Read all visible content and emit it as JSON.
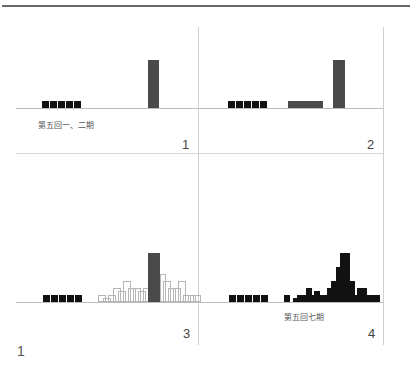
{
  "figure": {
    "number_label": "1",
    "panels": [
      {
        "id": 1,
        "number": "1",
        "caption": "第五回一、二期"
      },
      {
        "id": 2,
        "number": "2",
        "caption": ""
      },
      {
        "id": 3,
        "number": "3",
        "caption": ""
      },
      {
        "id": 4,
        "number": "4",
        "caption": "第五回七期"
      }
    ]
  },
  "colors": {
    "square": "#111111",
    "bar": "#4a4a4a",
    "outline": "#b5b5b5",
    "grid": "#cfcfcf",
    "top_rule": "#6a6a6a"
  },
  "chart_data": [
    {
      "type": "bar",
      "panel": "1",
      "title": "",
      "annotation": "第五回一、二期",
      "series": [
        {
          "name": "reference squares",
          "style": "black-square",
          "count": 5,
          "height_units": 1
        },
        {
          "name": "tall bar",
          "style": "dark-bar",
          "height_units": 7
        }
      ]
    },
    {
      "type": "bar",
      "panel": "2",
      "title": "",
      "series": [
        {
          "name": "reference squares",
          "style": "black-square",
          "count": 5,
          "height_units": 1
        },
        {
          "name": "wide low bar",
          "style": "dark-bar",
          "height_units": 1,
          "width_units": 5
        },
        {
          "name": "tall bar",
          "style": "dark-bar",
          "height_units": 7
        }
      ]
    },
    {
      "type": "bar",
      "panel": "3",
      "title": "",
      "series": [
        {
          "name": "reference squares",
          "style": "black-square",
          "count": 5,
          "height_units": 1
        },
        {
          "name": "outlined distribution",
          "style": "outlined-square",
          "column_heights": [
            1,
            0.5,
            1,
            2,
            1.5,
            3,
            2,
            2,
            1.5,
            2,
            3,
            4,
            4,
            3,
            2,
            2,
            3,
            1,
            1,
            1
          ]
        },
        {
          "name": "tall bar",
          "style": "dark-bar",
          "height_units": 7
        }
      ]
    },
    {
      "type": "bar",
      "panel": "4",
      "title": "",
      "annotation": "第五回七期",
      "series": [
        {
          "name": "reference squares",
          "style": "black-square",
          "count": 5,
          "height_units": 1
        },
        {
          "name": "stacked distribution",
          "style": "black-square",
          "column_heights": [
            1,
            0,
            0.5,
            1,
            1,
            2,
            1,
            1.5,
            1,
            1,
            2,
            3,
            5,
            7,
            7,
            3,
            1,
            2,
            2,
            1,
            1,
            1
          ]
        }
      ]
    }
  ]
}
